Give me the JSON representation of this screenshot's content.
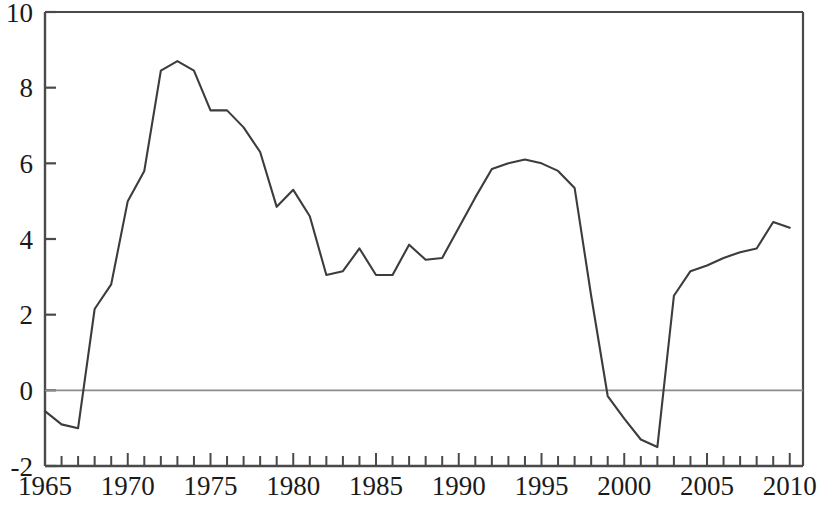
{
  "chart_data": {
    "type": "line",
    "title": "",
    "subtitle": "",
    "xlabel": "",
    "ylabel": "",
    "xlim": [
      1965,
      2010.8
    ],
    "ylim": [
      -2,
      10
    ],
    "grid": false,
    "legend": null,
    "zero_line": true,
    "y_ticks": [
      -2,
      0,
      2,
      4,
      6,
      8,
      10
    ],
    "y_tick_labels": [
      "-2",
      "0",
      "2",
      "4",
      "6",
      "8",
      "10"
    ],
    "x_ticks": [
      1965,
      1966,
      1967,
      1968,
      1969,
      1970,
      1971,
      1972,
      1973,
      1974,
      1975,
      1976,
      1977,
      1978,
      1979,
      1980,
      1981,
      1982,
      1983,
      1984,
      1985,
      1986,
      1987,
      1988,
      1989,
      1990,
      1991,
      1992,
      1993,
      1994,
      1995,
      1996,
      1997,
      1998,
      1999,
      2000,
      2001,
      2002,
      2003,
      2004,
      2005,
      2006,
      2007,
      2008,
      2009,
      2010
    ],
    "x_tick_labels": [
      "1965",
      "1970",
      "1975",
      "1980",
      "1985",
      "1990",
      "1995",
      "2000",
      "2005",
      "2010"
    ],
    "x_labeled_ticks": [
      1965,
      1970,
      1975,
      1980,
      1985,
      1990,
      1995,
      2000,
      2005,
      2010
    ],
    "line_color": "#3c3c3c",
    "zero_line_color": "#8c8c8c",
    "axis_color": "#4a4a4a",
    "series": [
      {
        "name": "series-1",
        "x": [
          1965,
          1966,
          1967,
          1968,
          1969,
          1970,
          1971,
          1972,
          1973,
          1974,
          1975,
          1976,
          1977,
          1978,
          1979,
          1980,
          1981,
          1982,
          1983,
          1984,
          1985,
          1986,
          1987,
          1988,
          1989,
          1990,
          1991,
          1992,
          1993,
          1994,
          1995,
          1996,
          1997,
          1998,
          1999,
          2000,
          2001,
          2002,
          2003,
          2004,
          2005,
          2006,
          2007,
          2008,
          2009,
          2010
        ],
        "values": [
          -0.55,
          -0.9,
          -1.0,
          2.15,
          2.8,
          5.0,
          5.8,
          8.45,
          8.7,
          8.45,
          7.4,
          7.4,
          6.95,
          6.3,
          4.85,
          5.3,
          4.6,
          3.05,
          3.15,
          3.75,
          3.05,
          3.05,
          3.85,
          3.45,
          3.5,
          4.3,
          5.1,
          5.85,
          6.0,
          6.1,
          6.0,
          5.8,
          5.35,
          2.5,
          -0.15,
          -0.75,
          -1.3,
          -1.5,
          2.5,
          3.15,
          3.3,
          3.5,
          3.65,
          3.75,
          4.45,
          4.3
        ]
      }
    ]
  }
}
